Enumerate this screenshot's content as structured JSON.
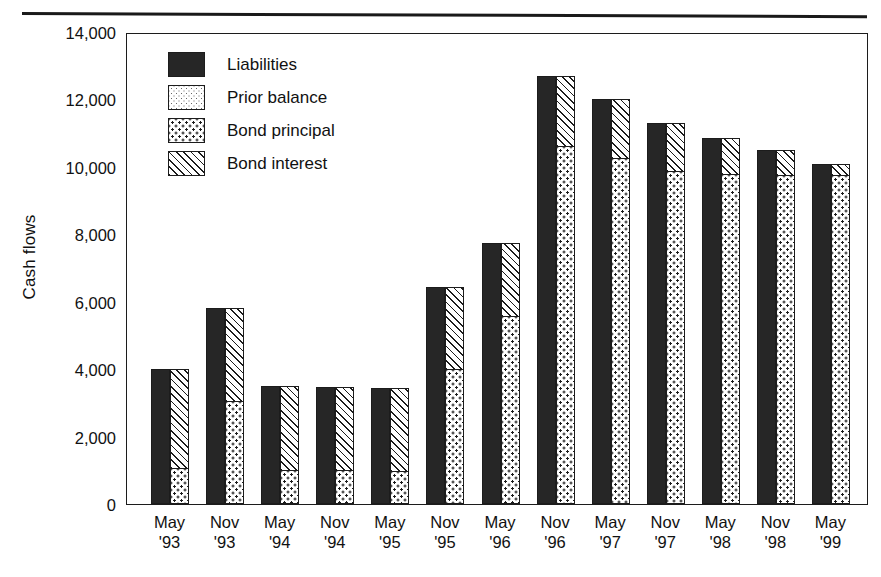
{
  "chart_data": {
    "type": "bar",
    "title": "",
    "xlabel": "",
    "ylabel": "Cash flows",
    "ylim": [
      0,
      14000
    ],
    "ytick_labels": [
      "0",
      "2,000",
      "4,000",
      "6,000",
      "8,000",
      "10,000",
      "12,000",
      "14,000"
    ],
    "ytick_values": [
      0,
      2000,
      4000,
      6000,
      8000,
      10000,
      12000,
      14000
    ],
    "grid": false,
    "legend_position": "upper-left-inside",
    "legend": [
      "Liabilities",
      "Prior balance",
      "Bond principal",
      "Bond interest"
    ],
    "categories": [
      "May '93",
      "Nov '93",
      "May '94",
      "Nov '94",
      "May '95",
      "Nov '95",
      "May '96",
      "Nov '96",
      "May '97",
      "Nov '97",
      "May '98",
      "Nov '98",
      "May '99"
    ],
    "category_lines": [
      [
        "May",
        "'93"
      ],
      [
        "Nov",
        "'93"
      ],
      [
        "May",
        "'94"
      ],
      [
        "Nov",
        "'94"
      ],
      [
        "May",
        "'95"
      ],
      [
        "Nov",
        "'95"
      ],
      [
        "May",
        "'96"
      ],
      [
        "Nov",
        "'96"
      ],
      [
        "May",
        "'97"
      ],
      [
        "Nov",
        "'97"
      ],
      [
        "May",
        "'98"
      ],
      [
        "Nov",
        "'98"
      ],
      [
        "May",
        "'99"
      ]
    ],
    "series": [
      {
        "name": "Liabilities",
        "stack": "left",
        "values": [
          4000,
          5800,
          3500,
          3470,
          3450,
          6450,
          7750,
          12700,
          12000,
          11300,
          10850,
          10500,
          10100
        ]
      },
      {
        "name": "Bond principal",
        "stack": "right",
        "values": [
          1050,
          3050,
          1000,
          1000,
          980,
          4000,
          5580,
          10650,
          10280,
          9900,
          9800,
          9780,
          9780
        ]
      },
      {
        "name": "Bond interest",
        "stack": "right",
        "values": [
          2950,
          2750,
          2500,
          2470,
          2470,
          2450,
          2170,
          2050,
          1720,
          1400,
          1050,
          720,
          320
        ]
      },
      {
        "name": "Prior balance",
        "stack": "right",
        "values": [
          0,
          0,
          0,
          0,
          0,
          0,
          0,
          0,
          0,
          0,
          0,
          0,
          0
        ]
      }
    ],
    "right_bar_totals": [
      4000,
      5800,
      3500,
      3470,
      3450,
      6450,
      7750,
      12700,
      12000,
      11300,
      10850,
      10500,
      10100
    ]
  }
}
